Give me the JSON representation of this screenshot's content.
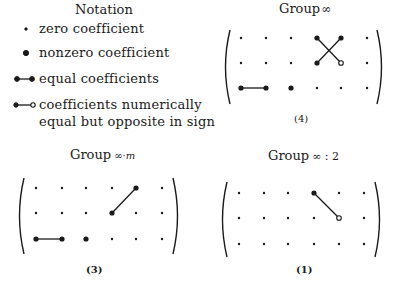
{
  "notation": {
    "title": "Notation",
    "items": [
      {
        "symbol": "small-dot",
        "label": "zero coefficient"
      },
      {
        "symbol": "large-dot",
        "label": "nonzero coefficient"
      },
      {
        "symbol": "dot-line-dot",
        "label": "equal coefficients"
      },
      {
        "symbol": "dot-line-open-circle",
        "label": "coefficients numerically"
      },
      {
        "symbol": "none",
        "label": "equal but opposite in sign"
      }
    ]
  },
  "panels": [
    {
      "title_main": "Group",
      "title_sym": "∞",
      "number": "(4)",
      "rows": 3,
      "cols": 6,
      "cells": [
        [
          "zero",
          "zero",
          "zero",
          "nonzero",
          "nonzero",
          "zero"
        ],
        [
          "zero",
          "zero",
          "zero",
          "nonzero",
          "open",
          "zero"
        ],
        [
          "nonzero",
          "nonzero",
          "nonzero",
          "zero",
          "zero",
          "zero"
        ]
      ],
      "links": [
        {
          "from": [
            2,
            0
          ],
          "to": [
            2,
            1
          ],
          "type": "equal"
        },
        {
          "from": [
            0,
            3
          ],
          "to": [
            1,
            4
          ],
          "type": "opposite"
        },
        {
          "from": [
            0,
            4
          ],
          "to": [
            1,
            3
          ],
          "type": "equal"
        }
      ]
    },
    {
      "title_main": "Group",
      "title_sym": "∞·m",
      "number": "(3)",
      "rows": 3,
      "cols": 6,
      "cells": [
        [
          "zero",
          "zero",
          "zero",
          "zero",
          "nonzero",
          "zero"
        ],
        [
          "zero",
          "zero",
          "zero",
          "nonzero",
          "zero",
          "zero"
        ],
        [
          "nonzero",
          "nonzero",
          "nonzero",
          "zero",
          "zero",
          "zero"
        ]
      ],
      "links": [
        {
          "from": [
            2,
            0
          ],
          "to": [
            2,
            1
          ],
          "type": "equal"
        },
        {
          "from": [
            0,
            4
          ],
          "to": [
            1,
            3
          ],
          "type": "equal"
        }
      ]
    },
    {
      "title_main": "Group",
      "title_sym": "∞ : 2",
      "number": "(1)",
      "rows": 3,
      "cols": 6,
      "cells": [
        [
          "zero",
          "zero",
          "zero",
          "nonzero",
          "zero",
          "zero"
        ],
        [
          "zero",
          "zero",
          "zero",
          "zero",
          "open",
          "zero"
        ],
        [
          "zero",
          "zero",
          "zero",
          "zero",
          "zero",
          "zero"
        ]
      ],
      "links": [
        {
          "from": [
            0,
            3
          ],
          "to": [
            1,
            4
          ],
          "type": "opposite"
        }
      ]
    }
  ]
}
